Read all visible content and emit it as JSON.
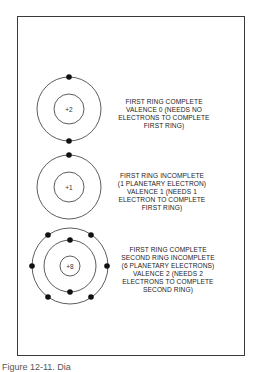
{
  "atoms": [
    {
      "nucleus_label": "+2",
      "rings": [
        {
          "electrons": 2
        }
      ],
      "description": [
        "FIRST RING COMPLETE",
        "VALENCE 0 (NEEDS NO",
        "ELECTRONS TO COMPLETE",
        "FIRST RING)"
      ]
    },
    {
      "nucleus_label": "+1",
      "rings": [
        {
          "electrons": 1
        }
      ],
      "description": [
        "FIRST RING INCOMPLETE",
        "(1 PLANETARY ELECTRON)",
        "VALENCE 1 (NEEDS 1",
        "ELECTRON TO COMPLETE",
        "FIRST RING)"
      ]
    },
    {
      "nucleus_label": "+8",
      "rings": [
        {
          "electrons": 2
        },
        {
          "electrons": 6
        }
      ],
      "description": [
        "FIRST RING COMPLETE",
        "SECOND RING INCOMPLETE",
        "(6 PLANETARY ELECTRONS)",
        "VALENCE 2 (NEEDS 2",
        "ELECTRONS TO COMPLETE",
        "SECOND RING)"
      ]
    }
  ],
  "caption": "Figure 12-11. Dia"
}
